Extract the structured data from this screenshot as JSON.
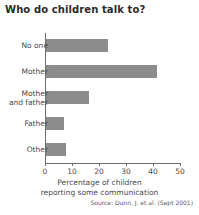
{
  "chart_data": {
    "type": "bar",
    "orientation": "horizontal",
    "title": "Who do children talk to?",
    "categories": [
      "No one",
      "Mother",
      "Mother\nand father",
      "Father",
      "Other"
    ],
    "values": [
      23,
      41,
      16,
      6.5,
      7.5
    ],
    "xlabel_line1": "Percentage of children",
    "xlabel_line2": "reporting some communication",
    "ylabel": "",
    "xlim": [
      0,
      50
    ],
    "xticks": [
      0,
      10,
      20,
      30,
      40,
      50
    ],
    "xtick_labels": [
      "0",
      "10",
      "20",
      "30",
      "40",
      "50"
    ],
    "grid": false,
    "legend": null,
    "bar_color": "#8c8c8c",
    "axis_color": "#6e6e6e",
    "background_color": "#ffffff",
    "source": "Source: Dunn, J. et al. (Sept 2001)"
  }
}
